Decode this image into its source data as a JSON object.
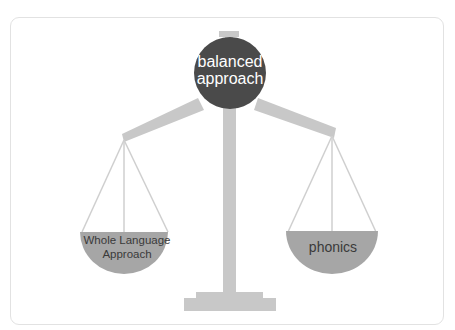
{
  "diagram": {
    "type": "balance-scale",
    "center": {
      "label_line1": "balanced",
      "label_line2": "approach"
    },
    "left_pan": {
      "label_line1": "Whole Language",
      "label_line2": "Approach"
    },
    "right_pan": {
      "label": "phonics"
    },
    "colors": {
      "frame_border": "#e2e2e2",
      "scale_body": "#c8c8c8",
      "center_circle": "#4a4a4a",
      "pan_fill": "#a6a6a6",
      "string": "#cfcfcf"
    }
  }
}
